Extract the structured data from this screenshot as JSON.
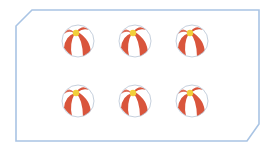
{
  "figure": {
    "frame": {
      "stroke": "#a9c4e4",
      "shape": "rectangle-with-cut-corners"
    },
    "object": "beach-ball",
    "rows": 2,
    "per_row": 3,
    "count": 6,
    "colors": {
      "stripe": "#d9553c",
      "white": "#ffffff",
      "cap": "#f2cf3a",
      "outline": "#b8c4d4"
    },
    "balls": [
      {
        "x": 61,
        "y": 24
      },
      {
        "x": 118,
        "y": 24
      },
      {
        "x": 175,
        "y": 24
      },
      {
        "x": 61,
        "y": 84
      },
      {
        "x": 118,
        "y": 84
      },
      {
        "x": 175,
        "y": 84
      }
    ]
  }
}
